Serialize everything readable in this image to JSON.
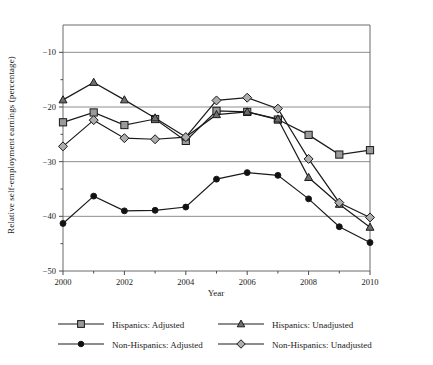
{
  "chart_data": {
    "type": "line",
    "title": "",
    "xlabel": "Year",
    "ylabel": "Relative self-employment earnings (percentage)",
    "x": [
      2000,
      2001,
      2002,
      2003,
      2004,
      2005,
      2006,
      2007,
      2008,
      2009,
      2010
    ],
    "xlim": [
      2000,
      2010
    ],
    "ylim": [
      -50,
      -5
    ],
    "xticks": [
      2000,
      2002,
      2004,
      2006,
      2008,
      2010
    ],
    "xticklabels": [
      "2000",
      "2002",
      "2004",
      "2006",
      "2008",
      "2010"
    ],
    "xminorticks": [
      2001,
      2003,
      2005,
      2007,
      2009
    ],
    "yticks": [
      -10,
      -20,
      -30,
      -40,
      -50
    ],
    "yticklabels": [
      "−10",
      "−20",
      "−30",
      "−40",
      "−50"
    ],
    "yminorticks": [
      -15,
      -25,
      -35,
      -45
    ],
    "grid": "horizontal",
    "legend_position": "below",
    "series": [
      {
        "name": "Hispanics: Adjusted",
        "marker": "square",
        "marker_fill": "#9a9a9a",
        "line_color": "#1a1a1a",
        "values": [
          -22.8,
          -21.0,
          -23.3,
          -22.2,
          -26.2,
          -20.7,
          -20.9,
          -22.3,
          -25.1,
          -28.7,
          -27.9
        ]
      },
      {
        "name": "Hispanics: Unadjusted",
        "marker": "triangle",
        "marker_fill": "#6e6e6e",
        "line_color": "#1a1a1a",
        "values": [
          -18.7,
          -15.5,
          -18.7,
          -22.0,
          -25.5,
          -21.4,
          -20.9,
          -22.2,
          -32.9,
          -37.8,
          -42.0
        ]
      },
      {
        "name": "Non-Hispanics: Adjusted",
        "marker": "circle",
        "marker_fill": "#111111",
        "line_color": "#1a1a1a",
        "values": [
          -41.3,
          -36.3,
          -39.0,
          -38.9,
          -38.3,
          -33.2,
          -32.0,
          -32.5,
          -36.8,
          -41.9,
          -44.8
        ]
      },
      {
        "name": "Non-Hispanics: Unadjusted",
        "marker": "diamond",
        "marker_fill": "#adadad",
        "line_color": "#1a1a1a",
        "values": [
          -27.2,
          -22.4,
          -25.7,
          -25.9,
          -25.5,
          -18.8,
          -18.3,
          -20.3,
          -29.5,
          -37.5,
          -40.2
        ]
      }
    ]
  },
  "legend": {
    "entries": [
      {
        "label": "Hispanics: Adjusted"
      },
      {
        "label": "Hispanics: Unadjusted"
      },
      {
        "label": "Non-Hispanics: Adjusted"
      },
      {
        "label": "Non-Hispanics: Unadjusted"
      }
    ]
  },
  "axes": {
    "x_title": "Year",
    "y_title": "Relative self-employment earnings (percentage)"
  }
}
